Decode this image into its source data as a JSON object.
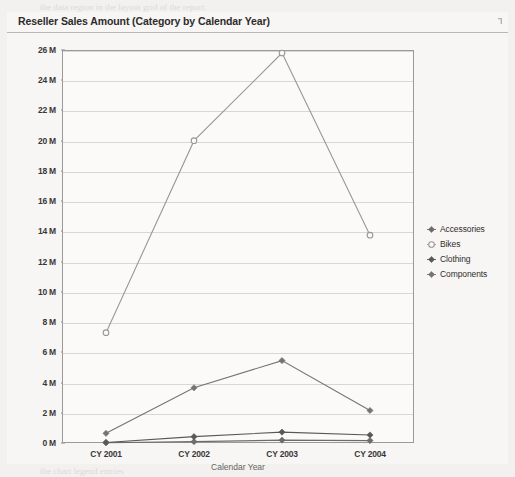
{
  "panel": {
    "title": "Reseller Sales Amount (Category by Calendar Year)",
    "corner_icon": "resize-handle-icon"
  },
  "chart_data": {
    "type": "line",
    "title": "Reseller Sales Amount (Category by Calendar Year)",
    "xlabel": "Calendar Year",
    "ylabel": "",
    "categories": [
      "CY 2001",
      "CY 2002",
      "CY 2003",
      "CY 2004"
    ],
    "ylim": [
      0,
      26000000
    ],
    "ytick_labels": [
      "0 M",
      "2 M",
      "4 M",
      "6 M",
      "8 M",
      "10 M",
      "12 M",
      "14 M",
      "16 M",
      "18 M",
      "20 M",
      "22 M",
      "24 M",
      "26 M"
    ],
    "ytick_values": [
      0,
      2000000,
      4000000,
      6000000,
      8000000,
      10000000,
      12000000,
      14000000,
      16000000,
      18000000,
      20000000,
      22000000,
      24000000,
      26000000
    ],
    "grid": true,
    "legend_position": "right",
    "series": [
      {
        "name": "Accessories",
        "marker": "diamond",
        "color": "#6e6c68",
        "values": [
          20000,
          90000,
          190000,
          160000
        ]
      },
      {
        "name": "Bikes",
        "marker": "circle-open",
        "color": "#9a9894",
        "values": [
          7300000,
          20000000,
          25800000,
          13750000
        ]
      },
      {
        "name": "Clothing",
        "marker": "diamond",
        "color": "#5a5854",
        "values": [
          35000,
          420000,
          720000,
          530000
        ]
      },
      {
        "name": "Components",
        "marker": "diamond",
        "color": "#76746f",
        "values": [
          640000,
          3650000,
          5450000,
          2150000
        ]
      }
    ]
  },
  "background_text": {
    "lines": [
      {
        "text": "the data region in the layout grid of the report.",
        "x": 40,
        "y": 2,
        "size": 9,
        "head": false
      },
      {
        "text": "Figure",
        "x": 244,
        "y": 152,
        "size": 10,
        "head": true
      },
      {
        "text": "The chart in the designer with a",
        "x": 244,
        "y": 168,
        "size": 9,
        "head": false
      },
      {
        "text": "and a data field dropped onto it",
        "x": 244,
        "y": 182,
        "size": 9,
        "head": false
      },
      {
        "text": "categories displayed along the",
        "x": 156,
        "y": 196,
        "size": 9,
        "head": false
      },
      {
        "text": "chart and the series grouped by",
        "x": 160,
        "y": 210,
        "size": 9,
        "head": false
      },
      {
        "text": "you can preview the report to see",
        "x": 252,
        "y": 282,
        "size": 9,
        "head": false
      },
      {
        "text": "the rendered chart control with",
        "x": 258,
        "y": 296,
        "size": 9,
        "head": false
      },
      {
        "text": "the sales values for each",
        "x": 266,
        "y": 310,
        "size": 9,
        "head": false
      },
      {
        "text": "Publishing the Report",
        "x": 252,
        "y": 346,
        "size": 11,
        "head": true
      },
      {
        "text": "Now that the report",
        "x": 256,
        "y": 364,
        "size": 9,
        "head": false
      },
      {
        "text": "is complete, the next",
        "x": 250,
        "y": 378,
        "size": 9,
        "head": false
      },
      {
        "text": "step is to deploy it",
        "x": 254,
        "y": 392,
        "size": 9,
        "head": false
      },
      {
        "text": "to the report server",
        "x": 258,
        "y": 406,
        "size": 9,
        "head": false
      },
      {
        "text": "and verify that the data",
        "x": 40,
        "y": 452,
        "size": 9,
        "head": false
      },
      {
        "text": "source connection settings are correct",
        "x": 150,
        "y": 452,
        "size": 9,
        "head": false
      },
      {
        "text": "the chart legend entries",
        "x": 40,
        "y": 466,
        "size": 9,
        "head": false
      }
    ]
  }
}
